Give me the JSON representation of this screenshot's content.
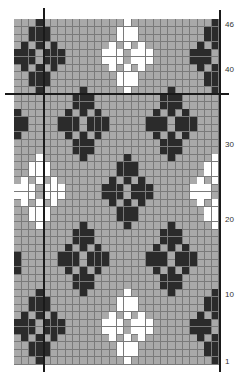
{
  "chart_data": {
    "type": "heatmap",
    "title": "",
    "columns": 28,
    "rows": 46,
    "colors": {
      "background": "#a9a9a9",
      "dark": "#2b2b2b",
      "white": "#ffffff",
      "gridline": "#7a7a7a",
      "rule": "#1a1a1a"
    },
    "row_labels": [
      {
        "row": 46,
        "text": "46"
      },
      {
        "row": 40,
        "text": "40"
      },
      {
        "row": 30,
        "text": "30"
      },
      {
        "row": 20,
        "text": "20"
      },
      {
        "row": 10,
        "text": "10"
      },
      {
        "row": 1,
        "text": "1"
      }
    ],
    "diamond_shape": [
      [
        0
      ],
      [
        -1,
        0,
        1
      ],
      [
        -1,
        0,
        1
      ],
      [
        -2,
        0,
        2
      ],
      [
        -3,
        -2,
        -1,
        1,
        2,
        3
      ],
      [
        -3,
        -2,
        -1,
        1,
        2,
        3
      ],
      [
        -2,
        0,
        2
      ],
      [
        -1,
        0,
        1
      ],
      [
        -1,
        0,
        1
      ],
      [
        0
      ]
    ],
    "motifs": [
      {
        "top_row": 46,
        "center_col": 3,
        "color": "dark"
      },
      {
        "top_row": 46,
        "center_col": 15,
        "color": "white"
      },
      {
        "top_row": 46,
        "center_col": 27,
        "color": "dark"
      },
      {
        "top_row": 37,
        "center_col": 9,
        "color": "dark"
      },
      {
        "top_row": 37,
        "center_col": 21,
        "color": "dark"
      },
      {
        "top_row": 28,
        "center_col": 3,
        "color": "white"
      },
      {
        "top_row": 28,
        "center_col": 15,
        "color": "dark"
      },
      {
        "top_row": 28,
        "center_col": 27,
        "color": "white"
      },
      {
        "top_row": 19,
        "center_col": 9,
        "color": "dark"
      },
      {
        "top_row": 19,
        "center_col": 21,
        "color": "dark"
      },
      {
        "top_row": 10,
        "center_col": 3,
        "color": "dark"
      },
      {
        "top_row": 10,
        "center_col": 15,
        "color": "white"
      },
      {
        "top_row": 10,
        "center_col": 27,
        "color": "dark"
      }
    ],
    "extra_cells": [
      {
        "row": 34,
        "col": 0,
        "color": "dark"
      },
      {
        "row": 33,
        "col": 0,
        "color": "dark"
      },
      {
        "row": 33,
        "col": 1,
        "color": "dark"
      },
      {
        "row": 32,
        "col": 0,
        "color": "dark"
      },
      {
        "row": 32,
        "col": 1,
        "color": "dark"
      },
      {
        "row": 31,
        "col": 0,
        "color": "dark"
      },
      {
        "row": 15,
        "col": 0,
        "color": "dark"
      },
      {
        "row": 14,
        "col": 0,
        "color": "dark"
      },
      {
        "row": 13,
        "col": 0,
        "color": "dark"
      }
    ],
    "rules": {
      "horizontal_between_rows": [
        37,
        36
      ],
      "vertical_after_col": 3
    },
    "grid": true
  }
}
